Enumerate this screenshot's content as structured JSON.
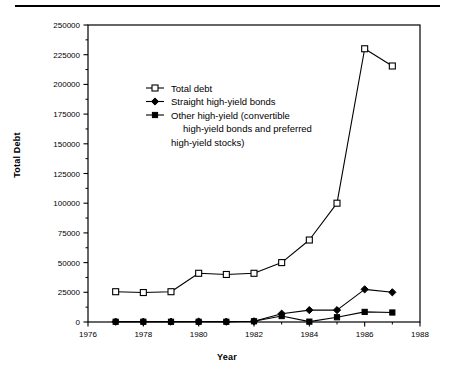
{
  "chart_data": {
    "type": "line",
    "title": "",
    "xlabel": "Year",
    "ylabel": "Total Debt",
    "xlim": [
      1976,
      1988
    ],
    "ylim": [
      0,
      250000
    ],
    "xticks": [
      1976,
      1977,
      1978,
      1979,
      1980,
      1981,
      1982,
      1983,
      1984,
      1985,
      1986,
      1987,
      1988
    ],
    "xtick_labels": [
      "1976",
      "",
      "1978",
      "",
      "1980",
      "",
      "1982",
      "",
      "1984",
      "",
      "1986",
      "",
      "1988"
    ],
    "xtick_labels_major": [
      "1976",
      "1978",
      "1980",
      "1982",
      "1984",
      "1986",
      "1988"
    ],
    "yticks": [
      0,
      25000,
      50000,
      75000,
      100000,
      125000,
      150000,
      175000,
      200000,
      225000,
      250000
    ],
    "ytick_labels": [
      "0",
      "25000",
      "50000",
      "75000",
      "100000",
      "125000",
      "150000",
      "175000",
      "200000",
      "225000",
      "250000"
    ],
    "grid": false,
    "legend_position": "upper-left-inside",
    "series": [
      {
        "name": "Total debt",
        "marker": "open-square",
        "x": [
          1977,
          1978,
          1979,
          1980,
          1981,
          1982,
          1983,
          1984,
          1985,
          1986,
          1987
        ],
        "values": [
          25500,
          24800,
          25500,
          41000,
          40000,
          41000,
          50000,
          69000,
          100000,
          230000,
          215500
        ]
      },
      {
        "name": "Straight high-yield bonds",
        "marker": "filled-diamond",
        "x": [
          1977,
          1978,
          1979,
          1980,
          1981,
          1982,
          1983,
          1984,
          1985,
          1986,
          1987
        ],
        "values": [
          300,
          300,
          300,
          400,
          300,
          600,
          7000,
          10000,
          10000,
          27500,
          25000
        ]
      },
      {
        "name": "Other high-yield (convertible high-yield bonds and preferred high-yield stocks)",
        "marker": "filled-square",
        "x": [
          1977,
          1978,
          1979,
          1980,
          1981,
          1982,
          1983,
          1984,
          1985,
          1986,
          1987
        ],
        "values": [
          200,
          200,
          200,
          200,
          200,
          600,
          5000,
          300,
          4000,
          8500,
          8000
        ]
      }
    ]
  },
  "legend": {
    "entries": [
      {
        "label": "Total debt",
        "marker": "open-square"
      },
      {
        "label": "Straight high-yield bonds",
        "marker": "filled-diamond"
      },
      {
        "label": "Other high-yield (convertible",
        "marker": "filled-square"
      }
    ],
    "wrap_line_2": "high-yield bonds and preferred",
    "wrap_line_3": "high-yield stocks)"
  },
  "axes": {
    "x_title": "Year",
    "y_title": "Total Debt"
  },
  "colors": {
    "line": "#000000",
    "background": "#ffffff",
    "marker_fill_open": "#ffffff",
    "marker_fill_solid": "#000000"
  }
}
